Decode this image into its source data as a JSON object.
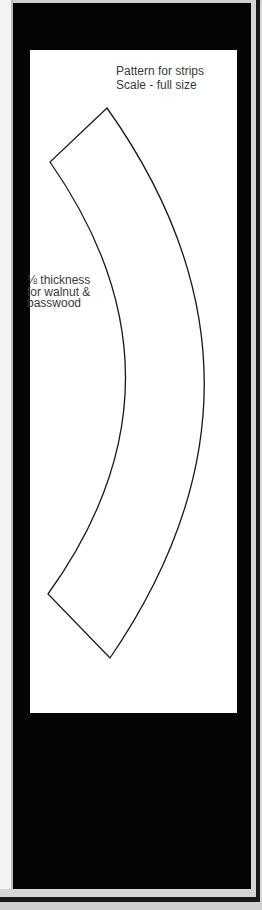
{
  "document": {
    "title_line1": "Pattern for strips",
    "title_line2": "Scale - full size",
    "note_line1": "⅛ thickness",
    "note_line2": "for walnut &",
    "note_line3": "basswood"
  },
  "pattern": {
    "shape": "curved-strip",
    "stroke_color": "#1a1a1a",
    "fill_color": "#ffffff"
  },
  "colors": {
    "frame": "#050505",
    "panel": "#ffffff",
    "text": "#3a3a3a"
  }
}
